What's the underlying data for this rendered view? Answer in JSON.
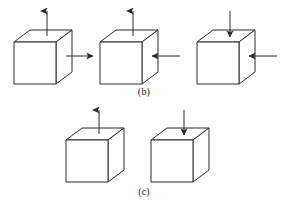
{
  "figure": {
    "background_color": "#ffffff",
    "line_color": "#2b2b2b",
    "line_width": 1,
    "width": 288,
    "height": 215
  },
  "captions": {
    "row_b": "(b)",
    "row_c": "(c)"
  },
  "rows": [
    {
      "id": "row-b",
      "label": "(b)",
      "cubes": [
        {
          "id": "cube-b1",
          "index": 1,
          "front_x": 14,
          "front_y": 42,
          "size": 42,
          "depth_x": 16,
          "depth_y": -12,
          "arrows": [
            {
              "name": "vertical-arrow-up-tension",
              "orientation": "vertical",
              "direction": "up",
              "sense": "tension",
              "from_x": 47,
              "from_y": 36,
              "to_x": 47,
              "to_y": 11
            },
            {
              "name": "horizontal-arrow-right-tension",
              "orientation": "horizontal",
              "direction": "right",
              "sense": "tension",
              "from_x": 66,
              "from_y": 56,
              "to_x": 93,
              "to_y": 56
            }
          ]
        },
        {
          "id": "cube-b2",
          "index": 2,
          "front_x": 100,
          "front_y": 42,
          "size": 42,
          "depth_x": 16,
          "depth_y": -12,
          "arrows": [
            {
              "name": "vertical-arrow-up-tension",
              "orientation": "vertical",
              "direction": "up",
              "sense": "tension",
              "from_x": 133,
              "from_y": 36,
              "to_x": 133,
              "to_y": 11
            },
            {
              "name": "horizontal-arrow-left-compression",
              "orientation": "horizontal",
              "direction": "left",
              "sense": "compression",
              "from_x": 180,
              "from_y": 56,
              "to_x": 152,
              "to_y": 56
            }
          ]
        },
        {
          "id": "cube-b3",
          "index": 3,
          "front_x": 197,
          "front_y": 42,
          "size": 42,
          "depth_x": 16,
          "depth_y": -12,
          "arrows": [
            {
              "name": "vertical-arrow-down-compression",
              "orientation": "vertical",
              "direction": "down",
              "sense": "compression",
              "from_x": 230,
              "from_y": 11,
              "to_x": 230,
              "to_y": 37
            },
            {
              "name": "horizontal-arrow-left-compression",
              "orientation": "horizontal",
              "direction": "left",
              "sense": "compression",
              "from_x": 277,
              "from_y": 56,
              "to_x": 249,
              "to_y": 56
            }
          ]
        }
      ]
    },
    {
      "id": "row-c",
      "label": "(c)",
      "cubes": [
        {
          "id": "cube-c1",
          "index": 4,
          "front_x": 66,
          "front_y": 140,
          "size": 42,
          "depth_x": 16,
          "depth_y": -12,
          "arrows": [
            {
              "name": "vertical-arrow-up-tension",
              "orientation": "vertical",
              "direction": "up",
              "sense": "tension",
              "from_x": 99,
              "from_y": 134,
              "to_x": 99,
              "to_y": 110
            }
          ]
        },
        {
          "id": "cube-c2",
          "index": 5,
          "front_x": 151,
          "front_y": 140,
          "size": 42,
          "depth_x": 16,
          "depth_y": -12,
          "arrows": [
            {
              "name": "vertical-arrow-down-compression",
              "orientation": "vertical",
              "direction": "down",
              "sense": "compression",
              "from_x": 184,
              "from_y": 110,
              "to_x": 184,
              "to_y": 135
            }
          ]
        }
      ]
    }
  ]
}
